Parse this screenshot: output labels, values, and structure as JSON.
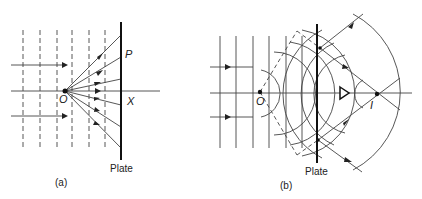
{
  "figure": {
    "panel_a": {
      "caption": "(a)",
      "plate_label": "Plate",
      "point_labels": {
        "source": "O",
        "point": "P",
        "axis_point": "X"
      }
    },
    "panel_b": {
      "caption": "(b)",
      "plate_label": "Plate",
      "point_labels": {
        "source": "O",
        "image": "I"
      },
      "observer": "eye-icon"
    },
    "colors": {
      "line": "#333333",
      "background": "#ffffff"
    }
  }
}
